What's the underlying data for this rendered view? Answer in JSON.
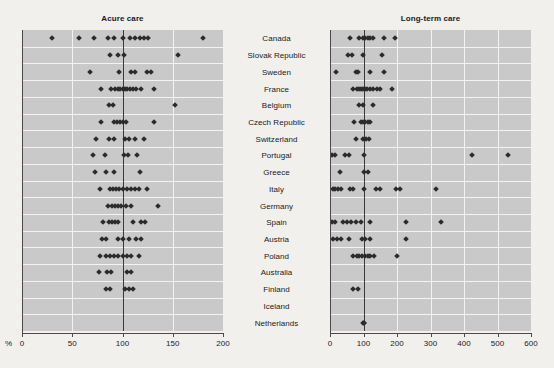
{
  "figure": {
    "unit_label": "%",
    "categories": [
      "Canada",
      "Slovak Republic",
      "Sweden",
      "France",
      "Belgium",
      "Czech Republic",
      "Switzerland",
      "Portugal",
      "Greece",
      "Italy",
      "Germany",
      "Spain",
      "Austria",
      "Poland",
      "Australia",
      "Finland",
      "Iceland",
      "Netherlands"
    ]
  },
  "chart_data": [
    {
      "type": "scatter",
      "title": "Acure care",
      "xlabel": "%",
      "ylabel": "",
      "xlim": [
        0,
        200
      ],
      "xticks": [
        0,
        50,
        100,
        150,
        200
      ],
      "xticklabels": [
        "0",
        "50",
        "100",
        "150",
        "200"
      ],
      "reference_line": 100,
      "grid": true,
      "legend": "none",
      "categories": [
        "Canada",
        "Slovak Republic",
        "Sweden",
        "France",
        "Belgium",
        "Czech Republic",
        "Switzerland",
        "Portugal",
        "Greece",
        "Italy",
        "Germany",
        "Spain",
        "Austria",
        "Poland",
        "Australia",
        "Finland",
        "Iceland",
        "Netherlands"
      ],
      "series": [
        {
          "name": "Canada",
          "values": [
            30,
            57,
            72,
            86,
            92,
            100,
            107,
            112,
            117,
            121,
            125,
            180
          ]
        },
        {
          "name": "Slovak Republic",
          "values": [
            88,
            96,
            101,
            155
          ]
        },
        {
          "name": "Sweden",
          "values": [
            68,
            97,
            108,
            112,
            124,
            128
          ]
        },
        {
          "name": "France",
          "values": [
            79,
            89,
            93,
            96,
            98,
            100,
            102,
            104,
            107,
            110,
            113,
            118,
            131
          ]
        },
        {
          "name": "Belgium",
          "values": [
            87,
            91,
            152
          ]
        },
        {
          "name": "Czech Republic",
          "values": [
            79,
            92,
            95,
            98,
            100,
            103,
            131
          ]
        },
        {
          "name": "Switzerland",
          "values": [
            74,
            87,
            92,
            102,
            106,
            112,
            121
          ]
        },
        {
          "name": "Portugal",
          "values": [
            71,
            83,
            101,
            105,
            114
          ]
        },
        {
          "name": "Greece",
          "values": [
            73,
            84,
            92,
            117
          ]
        },
        {
          "name": "Italy",
          "values": [
            78,
            88,
            91,
            94,
            97,
            100,
            104,
            108,
            112,
            116,
            124
          ]
        },
        {
          "name": "Germany",
          "values": [
            86,
            90,
            93,
            96,
            99,
            103,
            108,
            135
          ]
        },
        {
          "name": "Spain",
          "values": [
            81,
            87,
            90,
            93,
            96,
            110,
            118,
            122
          ]
        },
        {
          "name": "Austria",
          "values": [
            80,
            84,
            96,
            100,
            106,
            113,
            118
          ]
        },
        {
          "name": "Poland",
          "values": [
            78,
            84,
            88,
            92,
            96,
            100,
            104,
            108,
            116
          ]
        },
        {
          "name": "Australia",
          "values": [
            77,
            85,
            89,
            104,
            108
          ]
        },
        {
          "name": "Finland",
          "values": [
            84,
            88,
            102,
            106,
            110
          ]
        },
        {
          "name": "Iceland",
          "values": []
        },
        {
          "name": "Netherlands",
          "values": []
        }
      ]
    },
    {
      "type": "scatter",
      "title": "Long-term care",
      "xlabel": "",
      "ylabel": "",
      "xlim": [
        0,
        600
      ],
      "xticks": [
        0,
        100,
        200,
        300,
        400,
        500,
        600
      ],
      "xticklabels": [
        "0",
        "100",
        "200",
        "300",
        "400",
        "500",
        "600"
      ],
      "reference_line": 100,
      "grid": true,
      "legend": "none",
      "categories": [
        "Canada",
        "Slovak Republic",
        "Sweden",
        "France",
        "Belgium",
        "Czech Republic",
        "Switzerland",
        "Portugal",
        "Greece",
        "Italy",
        "Germany",
        "Spain",
        "Austria",
        "Poland",
        "Australia",
        "Finland",
        "Iceland",
        "Netherlands"
      ],
      "series": [
        {
          "name": "Canada",
          "values": [
            60,
            88,
            98,
            105,
            112,
            120,
            128,
            160,
            195
          ]
        },
        {
          "name": "Slovak Republic",
          "values": [
            55,
            65,
            98,
            155
          ]
        },
        {
          "name": "Sweden",
          "values": [
            18,
            78,
            84,
            120,
            160
          ]
        },
        {
          "name": "France",
          "values": [
            70,
            80,
            86,
            92,
            98,
            104,
            110,
            118,
            128,
            140,
            148,
            185
          ]
        },
        {
          "name": "Belgium",
          "values": [
            88,
            98,
            128
          ]
        },
        {
          "name": "Czech Republic",
          "values": [
            72,
            92,
            98,
            105,
            112,
            120
          ]
        },
        {
          "name": "Switzerland",
          "values": [
            78,
            98,
            108,
            115
          ]
        },
        {
          "name": "Portugal",
          "values": [
            5,
            14,
            45,
            56,
            100,
            425,
            530
          ]
        },
        {
          "name": "Greece",
          "values": [
            30,
            100,
            112
          ]
        },
        {
          "name": "Italy",
          "values": [
            8,
            16,
            24,
            32,
            60,
            70,
            100,
            138,
            148,
            198,
            208,
            315
          ]
        },
        {
          "name": "Germany",
          "values": []
        },
        {
          "name": "Spain",
          "values": [
            5,
            14,
            38,
            52,
            64,
            78,
            92,
            120,
            228,
            330
          ]
        },
        {
          "name": "Austria",
          "values": [
            8,
            22,
            32,
            56,
            96,
            104,
            118,
            228
          ]
        },
        {
          "name": "Poland",
          "values": [
            70,
            80,
            88,
            96,
            104,
            112,
            120,
            132,
            200
          ]
        },
        {
          "name": "Australia",
          "values": []
        },
        {
          "name": "Finland",
          "values": [
            68,
            85
          ]
        },
        {
          "name": "Iceland",
          "values": []
        },
        {
          "name": "Netherlands",
          "values": [
            98,
            100,
            102
          ]
        }
      ]
    }
  ]
}
